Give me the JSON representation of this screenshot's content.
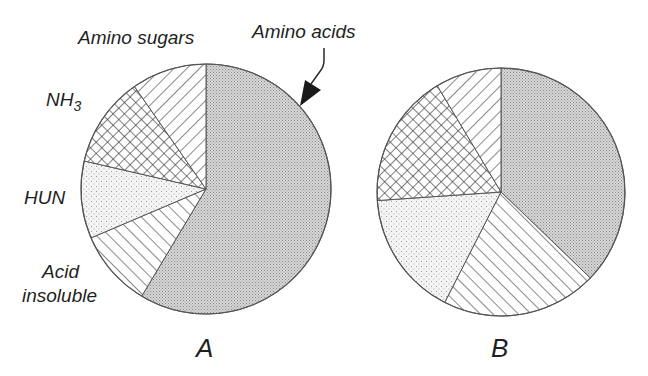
{
  "chart_data": [
    {
      "type": "pie",
      "title": "A",
      "categories": [
        "Amino acids",
        "Acid insoluble",
        "HUN",
        "NH3",
        "Amino sugars"
      ],
      "values": [
        58.6,
        10.0,
        10.0,
        11.7,
        9.7
      ],
      "start_angle_deg": 0,
      "direction": "clockwise",
      "patterns": [
        "dense-dots",
        "diagonal-right",
        "sparse-dots",
        "crosshatch",
        "diagonal-left"
      ]
    },
    {
      "type": "pie",
      "title": "B",
      "categories": [
        "Amino acids",
        "Acid insoluble",
        "HUN",
        "NH3",
        "Amino sugars"
      ],
      "values": [
        37.2,
        20.3,
        16.4,
        17.5,
        8.6
      ],
      "start_angle_deg": 0,
      "direction": "clockwise",
      "patterns": [
        "dense-dots",
        "diagonal-right",
        "sparse-dots",
        "crosshatch",
        "diagonal-left"
      ]
    }
  ],
  "labels": {
    "amino_sugars": "Amino sugars",
    "amino_acids": "Amino acids",
    "nh3_base": "NH",
    "nh3_sub": "3",
    "hun": "HUN",
    "acid_line1": "Acid",
    "acid_line2": "insoluble"
  },
  "pies": {
    "a": {
      "title": "A",
      "cx": 206,
      "cy": 189,
      "r": 125
    },
    "b": {
      "title": "B",
      "cx": 501,
      "cy": 192,
      "r": 124
    }
  },
  "colors": {
    "stroke": "#555555",
    "dense_dot": "#8a8a8a",
    "sparse_dot": "#9a9a9a",
    "hatch": "#3a3a3a"
  }
}
